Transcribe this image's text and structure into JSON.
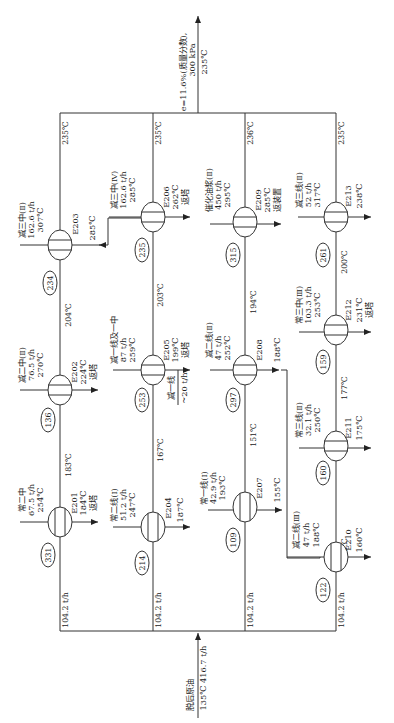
{
  "diagram": {
    "type": "heat-exchanger-network",
    "orientation": "rotated-90-ccw",
    "feed": {
      "name": "脱后原油",
      "conditions": "135℃ 416.7 t/h"
    },
    "outlet": {
      "line1": "e=11.6%(质量分数),",
      "line2": "300 kPa",
      "temp": "235℃"
    },
    "branches": [
      {
        "id": "branch-1",
        "flow": "104.2 t/h",
        "outlet_temp": "235℃",
        "segment_temps": [
          "183℃",
          "204℃"
        ],
        "exchangers": [
          {
            "id": "E201",
            "stream": "常二中",
            "flow": "67.5 t/h",
            "in_temp": "254℃",
            "out_temp": "184℃",
            "dest": "返塔",
            "duty": "331"
          },
          {
            "id": "E202",
            "stream": "减二中(Ⅱ)",
            "flow": "76.5 t/h",
            "in_temp": "270℃",
            "out_temp": "224℃",
            "dest": "返塔",
            "duty": "136"
          },
          {
            "id": "E203",
            "stream": "减三中(Ⅱ)",
            "flow": "162.6 t/h",
            "in_temp": "307℃",
            "out_temp": "285℃",
            "dest": "",
            "duty": "234"
          }
        ]
      },
      {
        "id": "branch-2",
        "flow": "104.2 t/h",
        "outlet_temp": "235℃",
        "segment_temps": [
          "167℃",
          "203℃"
        ],
        "exchangers": [
          {
            "id": "E204",
            "stream": "常二线(Ⅰ)",
            "flow": "51.2 t/h",
            "in_temp": "247℃",
            "out_temp": "187℃",
            "dest": "",
            "duty": "214"
          },
          {
            "id": "E205",
            "stream": "减一线及一中",
            "flow": "87 t/h",
            "in_temp": "259℃",
            "out_temp": "199℃",
            "dest": "返塔",
            "side_draw": "减一线",
            "side_flow": "~20 t/h",
            "duty": "253"
          },
          {
            "id": "E206",
            "stream": "减三中(Ⅳ)",
            "flow": "162.6 t/h",
            "in_temp": "285℃",
            "out_temp": "262℃",
            "dest": "返塔",
            "duty": "235"
          }
        ]
      },
      {
        "id": "branch-3",
        "flow": "104.2 t/h",
        "outlet_temp": "236℃",
        "segment_temps": [
          "151℃",
          "194℃"
        ],
        "exchangers": [
          {
            "id": "E207",
            "stream": "常一线(Ⅰ)",
            "flow": "42.9 t/h",
            "in_temp": "193℃",
            "out_temp": "155℃",
            "dest": "",
            "duty": "109"
          },
          {
            "id": "E208",
            "stream": "减二线(Ⅱ)",
            "flow": "47 t/h",
            "in_temp": "252℃",
            "out_temp": "188℃",
            "dest": "",
            "duty": "297"
          },
          {
            "id": "E209",
            "stream": "催化油浆(Ⅱ)",
            "flow": "450 t/h",
            "in_temp": "295℃",
            "out_temp": "285℃",
            "dest": "返装置",
            "duty": "315"
          }
        ]
      },
      {
        "id": "branch-4",
        "flow": "104.2 t/h",
        "outlet_temp": "235℃",
        "segment_temps": [
          "153℃",
          "177℃",
          "200℃"
        ],
        "exchangers": [
          {
            "id": "E210",
            "stream": "减二线(Ⅲ)",
            "flow": "47 t/h",
            "in_temp": "188℃",
            "out_temp": "160℃",
            "dest": "",
            "duty": "122"
          },
          {
            "id": "E211",
            "stream": "常三线(Ⅱ)",
            "flow": "32.1 t/h",
            "in_temp": "250℃",
            "out_temp": "175℃",
            "dest": "",
            "duty": "160"
          },
          {
            "id": "E212",
            "stream": "常三中(Ⅲ)",
            "flow": "103.3 t/h",
            "in_temp": "253℃",
            "out_temp": "231℃",
            "dest": "返塔",
            "duty": "159"
          },
          {
            "id": "E213",
            "stream": "减三线(Ⅱ)",
            "flow": "52 t/h",
            "in_temp": "317℃",
            "out_temp": "238℃",
            "dest": "",
            "duty": "261"
          }
        ]
      }
    ]
  },
  "labels": {
    "feed_name": "脱后原油",
    "feed_cond": "135℃ 416.7 t/h",
    "out_l1": "e=11.6%(质量分数),",
    "out_l2": "300 kPa",
    "out_temp": "235℃",
    "b1_flow": "104.2 t/h",
    "b2_flow": "104.2 t/h",
    "b3_flow": "104.2 t/h",
    "b4_flow": "104.2 t/h",
    "b1_top": "235℃",
    "b2_top": "235℃",
    "b3_top": "236℃",
    "b4_top": "235℃",
    "t183": "183℃",
    "t204": "204℃",
    "t167": "167℃",
    "t203": "203℃",
    "t151": "151℃",
    "t194": "194℃",
    "t153": "153℃",
    "t177": "177℃",
    "t200": "200℃",
    "e201_id": "E201",
    "e201_s": "常二中",
    "e201_f": "67.5 t/h",
    "e201_ti": "254℃",
    "e201_to": "184℃",
    "e201_d": "返塔",
    "e201_q": "331",
    "e202_id": "E202",
    "e202_s": "减二中(Ⅱ)",
    "e202_f": "76.5 t/h",
    "e202_ti": "270℃",
    "e202_to": "224℃",
    "e202_d": "返塔",
    "e202_q": "136",
    "e203_id": "E203",
    "e203_s": "减三中(Ⅱ)",
    "e203_f": "162.6 t/h",
    "e203_ti": "307℃",
    "e203_to": "285℃",
    "e203_q": "234",
    "e204_id": "E204",
    "e204_s": "常二线(Ⅰ)",
    "e204_f": "51.2 t/h",
    "e204_ti": "247℃",
    "e204_to": "187℃",
    "e204_q": "214",
    "e205_id": "E205",
    "e205_s": "减一线及一中",
    "e205_f": "87 t/h",
    "e205_ti": "259℃",
    "e205_to": "199℃",
    "e205_d": "返塔",
    "e205_side": "减一线",
    "e205_sf": "~20 t/h",
    "e205_q": "253",
    "e206_id": "E206",
    "e206_s": "减三中(Ⅳ)",
    "e206_f": "162.6 t/h",
    "e206_ti": "285℃",
    "e206_to": "262℃",
    "e206_d": "返塔",
    "e206_q": "235",
    "e207_id": "E207",
    "e207_s": "常一线(Ⅰ)",
    "e207_f": "42.9 t/h",
    "e207_ti": "193℃",
    "e207_to": "155℃",
    "e207_q": "109",
    "e208_id": "E208",
    "e208_s": "减二线(Ⅱ)",
    "e208_f": "47 t/h",
    "e208_ti": "252℃",
    "e208_to": "188℃",
    "e208_q": "297",
    "e209_id": "E209",
    "e209_s": "催化油浆(Ⅱ)",
    "e209_f": "450 t/h",
    "e209_ti": "295℃",
    "e209_to": "285℃",
    "e209_d": "返装置",
    "e209_q": "315",
    "e210_id": "E210",
    "e210_s": "减二线(Ⅲ)",
    "e210_f": "47 t/h",
    "e210_ti": "188℃",
    "e210_to": "160℃",
    "e210_q": "122",
    "e211_id": "E211",
    "e211_s": "常三线(Ⅱ)",
    "e211_f": "32.1 t/h",
    "e211_ti": "250℃",
    "e211_to": "175℃",
    "e211_q": "160",
    "e212_id": "E212",
    "e212_s": "常三中(Ⅲ)",
    "e212_f": "103.3 t/h",
    "e212_ti": "253℃",
    "e212_to": "231℃",
    "e212_d": "返塔",
    "e212_q": "159",
    "e213_id": "E213",
    "e213_s": "减三线(Ⅱ)",
    "e213_f": "52 t/h",
    "e213_ti": "317℃",
    "e213_to": "238℃",
    "e213_q": "261"
  },
  "colors": {
    "line": "#333333",
    "text": "#222222",
    "background": "#ffffff"
  }
}
